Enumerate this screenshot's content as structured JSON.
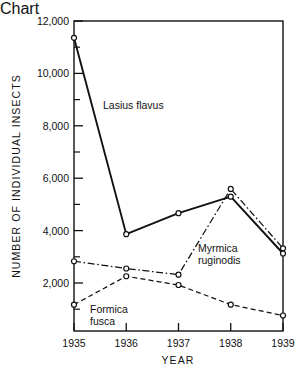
{
  "chart_data": {
    "type": "line",
    "title": "",
    "xlabel": "YEAR",
    "ylabel": "NUMBER OF INDIVIDUAL INSECTS",
    "x": [
      1935,
      1936,
      1937,
      1938,
      1939
    ],
    "categories": [
      "1935",
      "1936",
      "1937",
      "1938",
      "1939"
    ],
    "xlim": [
      1935,
      1939
    ],
    "ylim": [
      0,
      12000
    ],
    "ytick_labels": [
      "12,000",
      "10,000",
      "8,000",
      "6,000",
      "4,000",
      "2,000"
    ],
    "ytick_values": [
      12000,
      10000,
      8000,
      6000,
      4000,
      2000
    ],
    "yminor_values": [
      11000,
      9000,
      7000,
      5000,
      3000,
      1000
    ],
    "grid": false,
    "legend_position": "inline-annotations",
    "marker": "open-circle",
    "series": [
      {
        "name": "Lasius flavus",
        "linestyle": "solid",
        "color": "#111111",
        "values": [
          11350,
          3750,
          4560,
          5200,
          3000
        ],
        "label_text": "Lasius flavus"
      },
      {
        "name": "Myrmica ruginodis",
        "linestyle": "dashdot",
        "color": "#111111",
        "values": [
          2700,
          2420,
          2180,
          5500,
          3200
        ],
        "label_text_line1": "Myrmica",
        "label_text_line2": "ruginodis"
      },
      {
        "name": "Formica fusca",
        "linestyle": "dashed",
        "color": "#111111",
        "values": [
          1020,
          2120,
          1780,
          1020,
          600
        ],
        "label_text_line1": "Formica",
        "label_text_line2": "fusca"
      }
    ]
  },
  "axis": {
    "y_title": "NUMBER OF INDIVIDUAL INSECTS",
    "x_title": "YEAR",
    "y_ticks": [
      "12,000",
      "10,000",
      "8,000",
      "6,000",
      "4,000",
      "2,000"
    ],
    "x_ticks": [
      "1935",
      "1936",
      "1937",
      "1938",
      "1939"
    ]
  },
  "annotations": {
    "lasius": "Lasius flavus",
    "myrmica_line1": "Myrmica",
    "myrmica_line2": "ruginodis",
    "formica_line1": "Formica",
    "formica_line2": "fusca"
  }
}
